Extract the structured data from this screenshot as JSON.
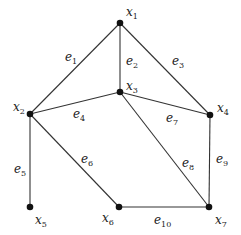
{
  "graph": {
    "nodes": [
      {
        "id": "x1",
        "base": "x",
        "sub": "1",
        "cx": 120,
        "cy": 23,
        "lx": 126,
        "ly": 16
      },
      {
        "id": "x2",
        "base": "x",
        "sub": "2",
        "cx": 30,
        "cy": 114,
        "lx": 13,
        "ly": 111
      },
      {
        "id": "x3",
        "base": "x",
        "sub": "3",
        "cx": 120,
        "cy": 92,
        "lx": 126,
        "ly": 90
      },
      {
        "id": "x4",
        "base": "x",
        "sub": "4",
        "cx": 210,
        "cy": 115,
        "lx": 217,
        "ly": 112
      },
      {
        "id": "x5",
        "base": "x",
        "sub": "5",
        "cx": 30,
        "cy": 207,
        "lx": 35,
        "ly": 224
      },
      {
        "id": "x6",
        "base": "x",
        "sub": "6",
        "cx": 119,
        "cy": 207,
        "lx": 102,
        "ly": 222
      },
      {
        "id": "x7",
        "base": "x",
        "sub": "7",
        "cx": 209,
        "cy": 207,
        "lx": 215,
        "ly": 224
      }
    ],
    "edges": [
      {
        "id": "e1",
        "base": "e",
        "sub": "1",
        "from": "x1",
        "to": "x2",
        "lx": 65,
        "ly": 61
      },
      {
        "id": "e2",
        "base": "e",
        "sub": "2",
        "from": "x1",
        "to": "x3",
        "lx": 126,
        "ly": 65
      },
      {
        "id": "e3",
        "base": "e",
        "sub": "3",
        "from": "x1",
        "to": "x4",
        "lx": 172,
        "ly": 65
      },
      {
        "id": "e4",
        "base": "e",
        "sub": "4",
        "from": "x2",
        "to": "x3",
        "lx": 73,
        "ly": 118
      },
      {
        "id": "e5",
        "base": "e",
        "sub": "5",
        "from": "x2",
        "to": "x5",
        "lx": 14,
        "ly": 173
      },
      {
        "id": "e6",
        "base": "e",
        "sub": "6",
        "from": "x2",
        "to": "x6",
        "lx": 81,
        "ly": 163
      },
      {
        "id": "e7",
        "base": "e",
        "sub": "7",
        "from": "x3",
        "to": "x4",
        "lx": 166,
        "ly": 122
      },
      {
        "id": "e8",
        "base": "e",
        "sub": "8",
        "from": "x3",
        "to": "x7",
        "lx": 182,
        "ly": 167
      },
      {
        "id": "e9",
        "base": "e",
        "sub": "9",
        "from": "x4",
        "to": "x7",
        "lx": 216,
        "ly": 163
      },
      {
        "id": "e10",
        "base": "e",
        "sub": "10",
        "from": "x6",
        "to": "x7",
        "lx": 154,
        "ly": 224
      }
    ]
  }
}
